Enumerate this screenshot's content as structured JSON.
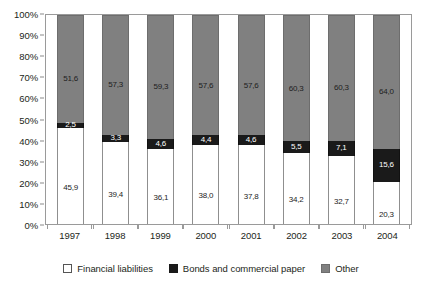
{
  "chart_data": {
    "type": "bar",
    "subtype": "stacked-100-percent",
    "title": "",
    "xlabel": "",
    "ylabel": "",
    "ylim": [
      0,
      100
    ],
    "ytick_labels": [
      "100%",
      "90%",
      "80%",
      "70%",
      "60%",
      "50%",
      "40%",
      "30%",
      "20%",
      "10%",
      "0%"
    ],
    "ytick_values": [
      100,
      90,
      80,
      70,
      60,
      50,
      40,
      30,
      20,
      10,
      0
    ],
    "grid": false,
    "legend_position": "bottom",
    "decimal_separator": ",",
    "categories": [
      "1997",
      "1998",
      "1999",
      "2000",
      "2001",
      "2002",
      "2003",
      "2004"
    ],
    "series": [
      {
        "name": "Financial liabilities",
        "color": "#ffffff",
        "values": [
          45.9,
          39.4,
          36.1,
          38.0,
          37.8,
          34.2,
          32.7,
          20.3
        ],
        "labels": [
          "45,9",
          "39,4",
          "36,1",
          "38,0",
          "37,8",
          "34,2",
          "32,7",
          "20,3"
        ]
      },
      {
        "name": "Bonds and commercial paper",
        "color": "#1a1a1a",
        "values": [
          2.5,
          3.3,
          4.6,
          4.4,
          4.6,
          5.5,
          7.1,
          15.6
        ],
        "labels": [
          "2,5",
          "3,3",
          "4,6",
          "4,4",
          "4,6",
          "5,5",
          "7,1",
          "15,6"
        ]
      },
      {
        "name": "Other",
        "color": "#808080",
        "values": [
          51.6,
          57.3,
          59.3,
          57.6,
          57.6,
          60.3,
          60.3,
          64.0
        ],
        "labels": [
          "51,6",
          "57,3",
          "59,3",
          "57,6",
          "57,6",
          "60,3",
          "60,3",
          "64,0"
        ]
      }
    ]
  },
  "legend": {
    "items": [
      {
        "label": "Financial liabilities",
        "swatch": "fin"
      },
      {
        "label": "Bonds and commercial paper",
        "swatch": "bonds"
      },
      {
        "label": "Other",
        "swatch": "other"
      }
    ]
  }
}
